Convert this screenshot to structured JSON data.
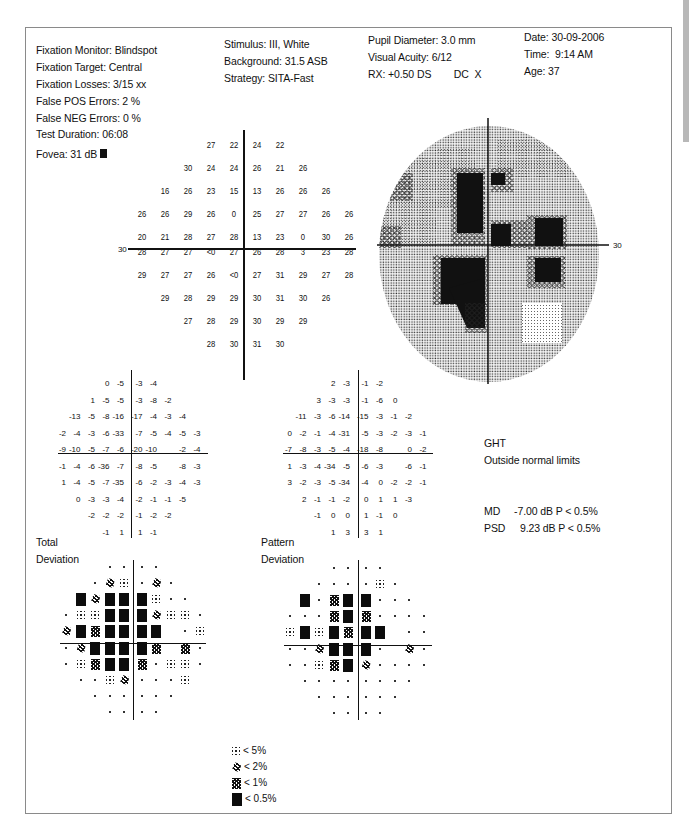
{
  "header": {
    "col1": {
      "fixation_monitor": "Fixation Monitor: Blindspot",
      "fixation_target": "Fixation Target: Central",
      "fixation_losses": "Fixation Losses: 3/15 xx",
      "false_pos": "False POS Errors:   2 %",
      "false_neg": "False NEG Errors:   0 %",
      "test_duration": "Test Duration: 06:08",
      "fovea": "Fovea: 31 dB"
    },
    "col2": {
      "stimulus": "Stimulus: III, White",
      "background": "Background: 31.5 ASB",
      "strategy": "Strategy: SITA-Fast"
    },
    "col3": {
      "pupil": "Pupil Diameter: 3.0 mm",
      "acuity": "Visual Acuity: 6/12",
      "rx": "RX: +0.50 DS        DC  X"
    },
    "col4": {
      "date": "Date: 30-09-2006",
      "time": "Time:  9:14 AM",
      "age": "Age: 37"
    }
  },
  "threshold_plot": {
    "axis_label": "30",
    "rows": [
      [
        "",
        "",
        "",
        "27",
        "22",
        "24",
        "22",
        "",
        "",
        ""
      ],
      [
        "",
        "",
        "30",
        "24",
        "24",
        "26",
        "21",
        "26",
        "",
        ""
      ],
      [
        "",
        "16",
        "26",
        "23",
        "15",
        "13",
        "26",
        "26",
        "26",
        ""
      ],
      [
        "26",
        "26",
        "29",
        "26",
        "0",
        "25",
        "27",
        "27",
        "26",
        "26"
      ],
      [
        "20",
        "21",
        "28",
        "27",
        "28",
        "13",
        "23",
        "0",
        "30",
        "26"
      ],
      [
        "28",
        "27",
        "27",
        "<0",
        "27",
        "26",
        "28",
        "3",
        "23",
        "28"
      ],
      [
        "29",
        "27",
        "27",
        "26",
        "<0",
        "27",
        "31",
        "29",
        "27",
        "28"
      ],
      [
        "",
        "29",
        "28",
        "29",
        "29",
        "30",
        "31",
        "30",
        "26",
        ""
      ],
      [
        "",
        "",
        "27",
        "28",
        "29",
        "30",
        "29",
        "29",
        "",
        ""
      ],
      [
        "",
        "",
        "",
        "28",
        "30",
        "31",
        "30",
        "",
        "",
        ""
      ]
    ]
  },
  "grayscale_plot": {
    "axis_label": "30"
  },
  "total_deviation": {
    "label_line1": "Total",
    "label_line2": "Deviation",
    "rows": [
      [
        "",
        "",
        "",
        "0",
        "-5",
        "-3",
        "-4",
        "",
        "",
        ""
      ],
      [
        "",
        "",
        "1",
        "-5",
        "-5",
        "-3",
        "-8",
        "-2",
        "",
        ""
      ],
      [
        "",
        "-13",
        "-5",
        "-8",
        "-16",
        "-17",
        "-4",
        "-3",
        "-4",
        ""
      ],
      [
        "-2",
        "-4",
        "-3",
        "-6",
        "-33",
        "-7",
        "-5",
        "-4",
        "-5",
        "-3"
      ],
      [
        "-9",
        "-10",
        "-5",
        "-7",
        "-6",
        "-20",
        "-10",
        "",
        "-2",
        "-4"
      ],
      [
        "-1",
        "-4",
        "-6",
        "-36",
        "-7",
        "-8",
        "-5",
        "",
        "-8",
        "-3"
      ],
      [
        "1",
        "-4",
        "-5",
        "-7",
        "-35",
        "-6",
        "-2",
        "-3",
        "-4",
        "-3"
      ],
      [
        "",
        "0",
        "-3",
        "-3",
        "-4",
        "-2",
        "-1",
        "-1",
        "-5",
        ""
      ],
      [
        "",
        "",
        "-2",
        "-2",
        "-2",
        "-1",
        "-2",
        "-2",
        "",
        ""
      ],
      [
        "",
        "",
        "",
        "-1",
        "1",
        "1",
        "-1",
        "",
        "",
        ""
      ]
    ],
    "prob_rows": [
      [
        "",
        "",
        "",
        "dot",
        "dot",
        "dot",
        "dot",
        "",
        "",
        ""
      ],
      [
        "",
        "",
        "dot",
        "p2",
        "p5",
        "dot",
        "p2",
        "dot",
        "",
        ""
      ],
      [
        "",
        "p05",
        "p2",
        "p05",
        "p05",
        "p05",
        "p5",
        "dot",
        "dot",
        ""
      ],
      [
        "dot",
        "p5",
        "p5",
        "p05",
        "p05",
        "p05",
        "p2",
        "p5",
        "p5",
        "dot"
      ],
      [
        "p2",
        "p05",
        "p1",
        "p05",
        "p05",
        "p05",
        "p05",
        "",
        "dot",
        "p5"
      ],
      [
        "dot",
        "p2",
        "p05",
        "p05",
        "p05",
        "p05",
        "p1",
        "",
        "p1",
        "dot"
      ],
      [
        "dot",
        "p5",
        "p1",
        "p05",
        "p05",
        "p1",
        "dot",
        "p5",
        "p5",
        "dot"
      ],
      [
        "",
        "dot",
        "dot",
        "p5",
        "p2",
        "dot",
        "dot",
        "dot",
        "p5",
        ""
      ],
      [
        "",
        "",
        "dot",
        "dot",
        "dot",
        "dot",
        "dot",
        "dot",
        "",
        ""
      ],
      [
        "",
        "",
        "",
        "dot",
        "dot",
        "dot",
        "dot",
        "",
        "",
        ""
      ]
    ]
  },
  "pattern_deviation": {
    "label_line1": "Pattern",
    "label_line2": "Deviation",
    "rows": [
      [
        "",
        "",
        "",
        "2",
        "-3",
        "-1",
        "-2",
        "",
        "",
        ""
      ],
      [
        "",
        "",
        "3",
        "-3",
        "-3",
        "-1",
        "-6",
        "0",
        "",
        ""
      ],
      [
        "",
        "-11",
        "-3",
        "-6",
        "-14",
        "-15",
        "-3",
        "-1",
        "-2",
        ""
      ],
      [
        "0",
        "-2",
        "-1",
        "-4",
        "-31",
        "-5",
        "-3",
        "-2",
        "-3",
        "-1"
      ],
      [
        "-7",
        "-8",
        "-3",
        "-5",
        "-4",
        "-18",
        "-8",
        "",
        "0",
        "-2"
      ],
      [
        "1",
        "-3",
        "-4",
        "-34",
        "-5",
        "-6",
        "-3",
        "",
        "-6",
        "-1"
      ],
      [
        "3",
        "-2",
        "-3",
        "-5",
        "-34",
        "-4",
        "0",
        "-2",
        "-2",
        "-1"
      ],
      [
        "",
        "2",
        "-1",
        "-1",
        "-2",
        "0",
        "1",
        "1",
        "-3",
        ""
      ],
      [
        "",
        "",
        "-1",
        "0",
        "0",
        "1",
        "-1",
        "0",
        "",
        ""
      ],
      [
        "",
        "",
        "",
        "1",
        "3",
        "3",
        "1",
        "",
        "",
        ""
      ]
    ],
    "prob_rows": [
      [
        "",
        "",
        "",
        "dot",
        "dot",
        "dot",
        "dot",
        "",
        "",
        ""
      ],
      [
        "",
        "",
        "dot",
        "dot",
        "dot",
        "dot",
        "p5",
        "dot",
        "",
        ""
      ],
      [
        "",
        "p05",
        "dot",
        "p1",
        "p05",
        "p05",
        "dot",
        "dot",
        "dot",
        ""
      ],
      [
        "dot",
        "dot",
        "dot",
        "p1",
        "p05",
        "p1",
        "dot",
        "dot",
        "dot",
        "dot"
      ],
      [
        "p5",
        "p05",
        "p5",
        "p05",
        "p1",
        "p05",
        "p05",
        "",
        "dot",
        "dot"
      ],
      [
        "dot",
        "dot",
        "p2",
        "p05",
        "p05",
        "p05",
        "dot",
        "",
        "p2",
        "dot"
      ],
      [
        "dot",
        "dot",
        "p5",
        "p1",
        "p05",
        "p2",
        "dot",
        "dot",
        "dot",
        "dot"
      ],
      [
        "",
        "dot",
        "dot",
        "dot",
        "dot",
        "dot",
        "dot",
        "dot",
        "dot",
        ""
      ],
      [
        "",
        "",
        "dot",
        "dot",
        "dot",
        "dot",
        "dot",
        "dot",
        "",
        ""
      ],
      [
        "",
        "",
        "",
        "dot",
        "dot",
        "dot",
        "dot",
        "",
        "",
        ""
      ]
    ]
  },
  "ght": {
    "title": "GHT",
    "result": "Outside normal limits"
  },
  "indices": {
    "md_label": "MD",
    "md_value": "-7.00 dB  P < 0.5%",
    "psd_label": "PSD",
    "psd_value": "9.23 dB  P < 0.5%"
  },
  "legend": [
    {
      "symbol": "p5",
      "label": "< 5%"
    },
    {
      "symbol": "p2",
      "label": "< 2%"
    },
    {
      "symbol": "p1",
      "label": "< 1%"
    },
    {
      "symbol": "p05",
      "label": "< 0.5%"
    }
  ]
}
